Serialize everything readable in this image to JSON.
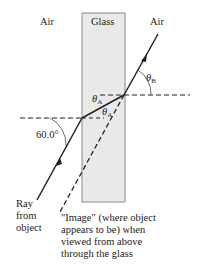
{
  "diagram": {
    "regions": [
      {
        "label": "Air"
      },
      {
        "label": "Glass"
      },
      {
        "label": "Air"
      }
    ],
    "angles": {
      "incidence": "60.0°",
      "theta_A": {
        "symbol": "θ",
        "sub": "A"
      },
      "theta_A_lower": {
        "symbol": "θ",
        "sub": "A"
      },
      "theta_B": {
        "symbol": "θ",
        "sub": "B"
      }
    },
    "ray_label": [
      "Ray",
      "from",
      "object"
    ],
    "image_label": [
      "\"Image\" (where object",
      "appears to be) when",
      "viewed from above",
      "through the glass"
    ],
    "colors": {
      "glass_fill": "#e9e9e9",
      "glass_border": "#8a8a8a",
      "ray": "#222222"
    }
  }
}
